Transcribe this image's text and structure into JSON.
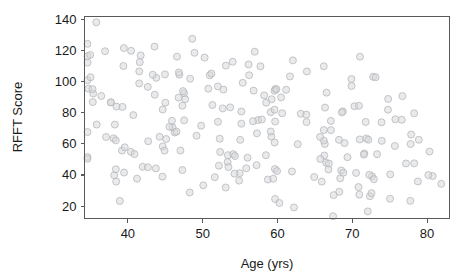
{
  "figure": {
    "background_color": "#ffffff",
    "frame_color": "#58595b",
    "marker_fill": "#d7d8da",
    "marker_stroke": "#b4b6b9"
  },
  "chart_data": {
    "type": "scatter",
    "title": "",
    "xlabel": "Age (yrs)",
    "ylabel": "RFFT Score",
    "xlim": [
      34.2,
      83.0
    ],
    "ylim": [
      12.0,
      142.0
    ],
    "xticks": [
      40,
      50,
      60,
      70,
      80
    ],
    "yticks": [
      20,
      40,
      60,
      80,
      100,
      120,
      140
    ],
    "xtick_labels": [
      "40",
      "50",
      "60",
      "70",
      "80"
    ],
    "ytick_labels": [
      "20",
      "40",
      "60",
      "80",
      "100",
      "120",
      "140"
    ],
    "grid": false,
    "legend": null,
    "marker": "open-circle",
    "marker_size": 7,
    "n_points": 460,
    "series": [
      {
        "name": "Participants",
        "x": [
          35.3,
          35.4,
          35.5,
          35.6,
          35.7,
          35.8,
          35.9,
          36.0,
          36.1,
          36.2,
          36.3,
          36.4,
          36.5,
          36.6,
          36.7,
          36.8,
          36.9,
          37.0,
          37.1,
          37.2,
          37.4,
          37.6,
          37.8,
          38.0,
          38.2,
          38.4,
          38.6,
          38.8,
          39.0,
          39.2,
          39.4,
          39.6,
          39.8,
          40.0,
          40.2,
          40.4,
          40.6,
          40.8,
          41.0,
          41.2,
          41.4,
          41.6,
          41.8,
          42.0,
          42.2,
          42.4,
          42.6,
          42.8,
          43.0,
          43.2,
          43.4,
          43.6,
          43.8,
          44.0,
          44.2,
          44.4,
          44.6,
          44.8,
          45.0,
          45.2,
          45.4,
          45.6,
          45.8,
          46.0,
          46.2,
          46.4,
          46.6,
          46.8,
          47.0,
          47.2,
          47.4,
          47.6,
          47.8,
          48.0,
          48.2,
          48.4,
          48.6,
          48.8,
          49.0,
          49.2,
          49.4,
          49.6,
          49.8,
          50.0,
          50.2,
          50.4,
          50.6,
          50.8,
          51.0,
          51.2,
          51.4,
          51.6,
          51.8,
          52.0,
          52.2,
          52.4,
          52.6,
          52.8,
          53.0,
          53.2,
          53.4,
          53.6,
          53.8,
          54.0,
          54.2,
          54.4,
          54.6,
          54.8,
          55.0,
          55.2,
          55.4,
          55.6,
          55.8,
          56.0,
          56.2,
          56.4,
          56.6,
          56.8,
          57.0,
          57.2,
          57.4,
          57.6,
          57.8,
          58.0,
          58.2,
          58.4,
          58.6,
          58.8,
          59.0,
          59.2,
          59.4,
          59.6,
          59.8,
          60.0,
          60.2,
          60.4,
          60.6,
          60.8,
          61.0,
          61.2,
          61.4,
          61.6,
          61.8,
          62.0,
          62.2,
          62.4,
          62.6,
          62.8,
          63.0,
          63.2,
          63.4,
          63.6,
          63.8,
          64.0,
          64.2,
          64.4,
          64.6,
          64.8,
          65.0,
          65.2,
          65.4,
          65.6,
          65.8,
          66.0,
          66.2,
          66.4,
          66.6,
          66.8,
          67.0,
          67.2,
          67.4,
          67.6,
          67.8,
          68.0,
          68.2,
          68.4,
          68.6,
          68.8,
          69.0,
          69.2,
          69.4,
          69.6,
          69.8,
          70.0,
          70.2,
          70.4,
          70.6,
          70.8,
          71.0,
          71.2,
          71.4,
          71.6,
          71.8,
          72.0,
          72.2,
          72.4,
          72.6,
          72.8,
          73.0,
          73.2,
          73.4,
          73.6,
          73.8,
          74.0,
          74.2,
          74.4,
          74.6,
          74.8,
          75.0,
          75.2,
          75.4,
          75.6,
          75.8,
          76.0,
          76.4,
          76.8,
          77.2,
          77.6,
          78.0,
          78.4,
          78.8,
          79.2,
          79.6,
          80.0,
          80.4,
          80.8,
          81.2
        ],
        "y": [
          134,
          127,
          112,
          105,
          101,
          97,
          93,
          88,
          84,
          79,
          74,
          70,
          66,
          61,
          57,
          52,
          48,
          44,
          39,
          27,
          107,
          102,
          96,
          90,
          85,
          113,
          108,
          76,
          71,
          64,
          59,
          55,
          50,
          44,
          40,
          118,
          112,
          106,
          100,
          95,
          89,
          84,
          79,
          74,
          68,
          63,
          58,
          53,
          47,
          42,
          121,
          115,
          109,
          104,
          98,
          92,
          87,
          81,
          76,
          70,
          65,
          59,
          54,
          48,
          43,
          124,
          118,
          112,
          106,
          100,
          95,
          89,
          83,
          78,
          72,
          66,
          61,
          55,
          50,
          44,
          39,
          115,
          109,
          103,
          98,
          92,
          86,
          81,
          75,
          69,
          64,
          58,
          52,
          47,
          41,
          36,
          110,
          104,
          99,
          93,
          87,
          82,
          76,
          70,
          65,
          59,
          53,
          48,
          42,
          37,
          105,
          100,
          94,
          88,
          83,
          77,
          71,
          66,
          60,
          54,
          49,
          43,
          38,
          32,
          113,
          107,
          102,
          96,
          90,
          85,
          79,
          73,
          68,
          62,
          56,
          51,
          45,
          40,
          34,
          29,
          108,
          102,
          97,
          91,
          85,
          80,
          74,
          68,
          63,
          57,
          51,
          46,
          40,
          35,
          29,
          104,
          98,
          93,
          87,
          81,
          76,
          70,
          64,
          59,
          53,
          47,
          42,
          36,
          31,
          25,
          99,
          93,
          88,
          82,
          76,
          71,
          65,
          59,
          54,
          48,
          42,
          37,
          31,
          26,
          95,
          89,
          84,
          78,
          72,
          67,
          61,
          55,
          50,
          44,
          38,
          33,
          27,
          91,
          85,
          80,
          74,
          68,
          63,
          57,
          51,
          46,
          40,
          34,
          29,
          86,
          81,
          75,
          69,
          64,
          58,
          52,
          47,
          41,
          36,
          30,
          72,
          66,
          61,
          55,
          49,
          44,
          38
        ]
      }
    ]
  }
}
